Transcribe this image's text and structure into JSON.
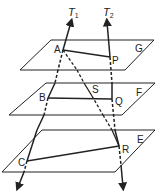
{
  "figure": {
    "colors": {
      "stroke": "#222222",
      "plane_fill": "#ffffff",
      "background": "#ffffff"
    },
    "transversals": [
      {
        "name": "T",
        "subscript": "1",
        "points": [
          "A",
          "B",
          "C"
        ]
      },
      {
        "name": "T",
        "subscript": "2",
        "points": [
          "P",
          "Q",
          "R"
        ]
      }
    ],
    "planes": [
      {
        "label": "G"
      },
      {
        "label": "F"
      },
      {
        "label": "E"
      }
    ],
    "points": {
      "A": "A",
      "P": "P",
      "B": "B",
      "S": "S",
      "Q": "Q",
      "C": "C",
      "R": "R"
    },
    "segments": [
      "AP",
      "BQ",
      "CR",
      "AR (dashed)"
    ]
  }
}
